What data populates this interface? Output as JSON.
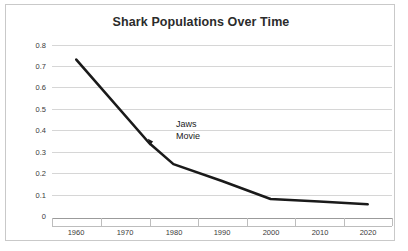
{
  "chart_data": {
    "type": "line",
    "title": "Shark Populations Over Time",
    "xlabel": "",
    "ylabel": "",
    "x": [
      1960,
      1975,
      1980,
      1990,
      2000,
      2010,
      2020
    ],
    "values": [
      0.75,
      0.355,
      0.255,
      0.175,
      0.09,
      0.078,
      0.065
    ],
    "series": [
      {
        "name": "Shark population index",
        "values": [
          0.75,
          0.355,
          0.255,
          0.175,
          0.09,
          0.078,
          0.065
        ]
      }
    ],
    "xlim": [
      1955,
      2025
    ],
    "ylim": [
      0,
      0.8
    ],
    "xticks": [
      1960,
      1970,
      1980,
      1990,
      2000,
      2010,
      2020
    ],
    "xtick_labels": [
      "1960",
      "1970",
      "1980",
      "1990",
      "2000",
      "2010",
      "2020"
    ],
    "yticks": [
      0,
      0.1,
      0.2,
      0.3,
      0.4,
      0.5,
      0.6,
      0.7,
      0.8
    ],
    "ytick_labels": [
      "0",
      "0.1",
      "0.2",
      "0.3",
      "0.4",
      "0.5",
      "0.6",
      "0.7",
      "0.8"
    ],
    "grid": true,
    "legend": false,
    "legend_position": "none",
    "annotations": [
      {
        "text_line1": "Jaws",
        "text_line2": "Movie",
        "points_to_x": 1975,
        "points_to_y": 0.355
      }
    ],
    "colors": {
      "line": "#1a1a1a",
      "grid": "#d6d6d6",
      "axis": "#9b9b9b",
      "text": "#3a3a3a",
      "title": "#2b2b2b",
      "border": "#c9c9c9",
      "background": "#ffffff"
    }
  }
}
